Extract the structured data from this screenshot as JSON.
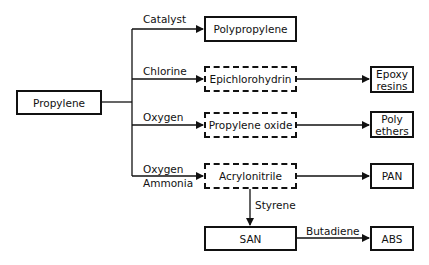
{
  "diagram": {
    "source": {
      "label": "Propylene"
    },
    "branches": [
      {
        "reagent": "Catalyst",
        "product": "Polypropylene",
        "intermediate": false
      },
      {
        "reagent": "Chlorine",
        "product": "Epichlorohydrin",
        "intermediate": true,
        "derivative": "Epoxy resins"
      },
      {
        "reagent": "Oxygen",
        "product": "Propylene oxide",
        "intermediate": true,
        "derivative": "Poly ethers"
      },
      {
        "reagent": "Oxygen",
        "reagent2": "Ammonia",
        "product": "Acrylonitrile",
        "intermediate": true,
        "derivative": "PAN"
      }
    ],
    "styrene_step": {
      "reagent": "Styrene",
      "product": "SAN"
    },
    "butadiene_step": {
      "reagent": "Butadiene",
      "product": "ABS"
    },
    "derivative_lines": {
      "epoxy": [
        "Epoxy",
        "resins"
      ],
      "poly": [
        "Poly",
        "ethers"
      ]
    }
  }
}
